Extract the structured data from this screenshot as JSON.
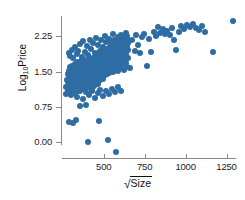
{
  "chart_data": {
    "type": "scatter",
    "title": "",
    "xlabel": "√Size",
    "ylabel": "Log10Price",
    "xlabel_parts": {
      "radical": "√",
      "radicand": "Size"
    },
    "ylabel_parts": {
      "base": "Log",
      "subscript": "10",
      "tail": "Price"
    },
    "xlim": [
      245,
      1320
    ],
    "ylim": [
      -0.35,
      2.72
    ],
    "xticks": [
      500,
      750,
      1000,
      1250
    ],
    "xtick_labels": [
      "500",
      "750",
      "1000",
      "1250"
    ],
    "yticks": [
      0.0,
      0.75,
      1.5,
      2.25
    ],
    "ytick_labels": [
      "0.00",
      "0.75",
      "1.50",
      "2.25"
    ],
    "grid": false,
    "legend": false,
    "marker_color": "#2e6da4",
    "marker_size_px": 6,
    "background": "#ffffff",
    "axis_color": "#8a8a8a",
    "n_points": 268,
    "points": [
      [
        286,
        0.44
      ],
      [
        311,
        0.42
      ],
      [
        330,
        0.47
      ],
      [
        352,
        0.78
      ],
      [
        392,
        0.8
      ],
      [
        405,
        0.02
      ],
      [
        470,
        0.46
      ],
      [
        523,
        0.05
      ],
      [
        572,
        -0.21
      ],
      [
        268,
        1.02
      ],
      [
        272,
        1.18
      ],
      [
        276,
        1.33
      ],
      [
        279,
        1.45
      ],
      [
        281,
        1.12
      ],
      [
        284,
        1.28
      ],
      [
        286,
        1.52
      ],
      [
        288,
        1.38
      ],
      [
        290,
        1.2
      ],
      [
        292,
        1.6
      ],
      [
        294,
        1.05
      ],
      [
        296,
        1.42
      ],
      [
        298,
        1.3
      ],
      [
        300,
        1.55
      ],
      [
        302,
        1.15
      ],
      [
        304,
        1.48
      ],
      [
        306,
        1.62
      ],
      [
        308,
        1.25
      ],
      [
        310,
        1.36
      ],
      [
        312,
        1.5
      ],
      [
        314,
        1.08
      ],
      [
        316,
        1.44
      ],
      [
        318,
        1.58
      ],
      [
        320,
        1.22
      ],
      [
        322,
        1.34
      ],
      [
        324,
        1.66
      ],
      [
        326,
        1.4
      ],
      [
        328,
        1.18
      ],
      [
        330,
        1.54
      ],
      [
        332,
        1.29
      ],
      [
        334,
        1.46
      ],
      [
        336,
        1.7
      ],
      [
        338,
        1.24
      ],
      [
        340,
        1.38
      ],
      [
        342,
        1.6
      ],
      [
        344,
        1.1
      ],
      [
        346,
        1.5
      ],
      [
        348,
        1.32
      ],
      [
        350,
        1.64
      ],
      [
        352,
        1.26
      ],
      [
        354,
        1.44
      ],
      [
        356,
        1.56
      ],
      [
        358,
        1.2
      ],
      [
        360,
        1.72
      ],
      [
        362,
        1.36
      ],
      [
        364,
        1.48
      ],
      [
        366,
        1.14
      ],
      [
        368,
        1.58
      ],
      [
        370,
        1.3
      ],
      [
        372,
        1.66
      ],
      [
        374,
        1.42
      ],
      [
        376,
        1.22
      ],
      [
        378,
        1.52
      ],
      [
        380,
        1.34
      ],
      [
        382,
        1.74
      ],
      [
        384,
        1.46
      ],
      [
        386,
        1.16
      ],
      [
        388,
        1.62
      ],
      [
        390,
        1.28
      ],
      [
        392,
        1.54
      ],
      [
        394,
        1.4
      ],
      [
        396,
        1.68
      ],
      [
        398,
        1.24
      ],
      [
        400,
        1.5
      ],
      [
        402,
        1.36
      ],
      [
        404,
        1.58
      ],
      [
        406,
        1.18
      ],
      [
        408,
        1.44
      ],
      [
        410,
        1.76
      ],
      [
        412,
        1.32
      ],
      [
        414,
        1.6
      ],
      [
        416,
        1.48
      ],
      [
        418,
        1.26
      ],
      [
        420,
        1.7
      ],
      [
        422,
        1.38
      ],
      [
        424,
        1.56
      ],
      [
        426,
        1.12
      ],
      [
        428,
        1.64
      ],
      [
        430,
        1.42
      ],
      [
        432,
        1.3
      ],
      [
        434,
        1.78
      ],
      [
        436,
        1.52
      ],
      [
        438,
        1.2
      ],
      [
        440,
        1.46
      ],
      [
        442,
        1.66
      ],
      [
        444,
        1.34
      ],
      [
        446,
        1.58
      ],
      [
        448,
        1.4
      ],
      [
        450,
        1.72
      ],
      [
        452,
        1.28
      ],
      [
        454,
        1.54
      ],
      [
        456,
        1.44
      ],
      [
        458,
        1.82
      ],
      [
        460,
        1.36
      ],
      [
        462,
        1.62
      ],
      [
        464,
        1.5
      ],
      [
        466,
        1.24
      ],
      [
        468,
        1.68
      ],
      [
        470,
        1.42
      ],
      [
        472,
        1.56
      ],
      [
        474,
        1.86
      ],
      [
        476,
        1.32
      ],
      [
        478,
        1.6
      ],
      [
        480,
        1.48
      ],
      [
        482,
        1.74
      ],
      [
        484,
        1.38
      ],
      [
        486,
        1.64
      ],
      [
        488,
        1.52
      ],
      [
        490,
        1.9
      ],
      [
        492,
        1.44
      ],
      [
        494,
        1.7
      ],
      [
        496,
        1.58
      ],
      [
        498,
        1.34
      ],
      [
        500,
        1.66
      ],
      [
        502,
        1.8
      ],
      [
        504,
        1.5
      ],
      [
        506,
        1.94
      ],
      [
        508,
        1.42
      ],
      [
        510,
        1.72
      ],
      [
        512,
        1.6
      ],
      [
        514,
        1.86
      ],
      [
        516,
        1.54
      ],
      [
        518,
        1.76
      ],
      [
        520,
        1.46
      ],
      [
        522,
        1.98
      ],
      [
        524,
        1.64
      ],
      [
        526,
        1.82
      ],
      [
        528,
        1.56
      ],
      [
        530,
        1.9
      ],
      [
        532,
        1.48
      ],
      [
        534,
        1.7
      ],
      [
        536,
        1.62
      ],
      [
        538,
        2.02
      ],
      [
        540,
        1.78
      ],
      [
        542,
        1.54
      ],
      [
        544,
        1.88
      ],
      [
        546,
        1.66
      ],
      [
        548,
        1.96
      ],
      [
        550,
        1.58
      ],
      [
        552,
        1.8
      ],
      [
        554,
        2.06
      ],
      [
        556,
        1.72
      ],
      [
        558,
        1.5
      ],
      [
        560,
        1.92
      ],
      [
        562,
        1.64
      ],
      [
        564,
        2.0
      ],
      [
        566,
        1.84
      ],
      [
        568,
        1.56
      ],
      [
        570,
        1.74
      ],
      [
        572,
        2.1
      ],
      [
        574,
        1.68
      ],
      [
        576,
        1.94
      ],
      [
        578,
        1.6
      ],
      [
        580,
        1.86
      ],
      [
        582,
        2.04
      ],
      [
        584,
        1.76
      ],
      [
        586,
        1.52
      ],
      [
        588,
        1.98
      ],
      [
        590,
        1.7
      ],
      [
        592,
        2.14
      ],
      [
        594,
        1.88
      ],
      [
        596,
        1.62
      ],
      [
        598,
        1.8
      ],
      [
        600,
        2.06
      ],
      [
        602,
        1.72
      ],
      [
        604,
        1.96
      ],
      [
        606,
        1.58
      ],
      [
        608,
        2.18
      ],
      [
        610,
        1.84
      ],
      [
        612,
        2.02
      ],
      [
        614,
        1.66
      ],
      [
        616,
        1.9
      ],
      [
        618,
        2.08
      ],
      [
        620,
        1.74
      ],
      [
        622,
        2.22
      ],
      [
        624,
        1.94
      ],
      [
        626,
        1.54
      ],
      [
        628,
        2.12
      ],
      [
        630,
        1.8
      ],
      [
        632,
        2.0
      ],
      [
        634,
        1.68
      ],
      [
        636,
        2.16
      ],
      [
        638,
        1.88
      ],
      [
        640,
        2.04
      ],
      [
        642,
        1.6
      ],
      [
        644,
        2.26
      ],
      [
        646,
        1.96
      ],
      [
        648,
        1.78
      ],
      [
        650,
        2.1
      ],
      [
        285,
        1.9
      ],
      [
        295,
        1.84
      ],
      [
        305,
        1.96
      ],
      [
        315,
        1.78
      ],
      [
        325,
        2.02
      ],
      [
        335,
        1.88
      ],
      [
        345,
        1.94
      ],
      [
        355,
        2.08
      ],
      [
        365,
        1.82
      ],
      [
        375,
        2.14
      ],
      [
        385,
        1.92
      ],
      [
        395,
        2.04
      ],
      [
        405,
        1.86
      ],
      [
        415,
        2.18
      ],
      [
        425,
        1.98
      ],
      [
        435,
        2.1
      ],
      [
        445,
        1.9
      ],
      [
        455,
        2.22
      ],
      [
        465,
        2.06
      ],
      [
        475,
        1.94
      ],
      [
        485,
        2.16
      ],
      [
        495,
        2.02
      ],
      [
        505,
        2.26
      ],
      [
        515,
        2.12
      ],
      [
        525,
        1.98
      ],
      [
        535,
        2.2
      ],
      [
        545,
        2.08
      ],
      [
        555,
        2.3
      ],
      [
        565,
        2.16
      ],
      [
        575,
        2.02
      ],
      [
        585,
        2.24
      ],
      [
        595,
        2.12
      ],
      [
        605,
        2.28
      ],
      [
        615,
        2.18
      ],
      [
        625,
        2.08
      ],
      [
        635,
        2.32
      ],
      [
        645,
        2.2
      ],
      [
        300,
        1.0
      ],
      [
        318,
        1.04
      ],
      [
        336,
        0.96
      ],
      [
        354,
        1.08
      ],
      [
        372,
        0.92
      ],
      [
        390,
        1.06
      ],
      [
        408,
        1.0
      ],
      [
        426,
        1.1
      ],
      [
        444,
        0.94
      ],
      [
        462,
        1.04
      ],
      [
        480,
        1.12
      ],
      [
        498,
        0.98
      ],
      [
        516,
        1.08
      ],
      [
        534,
        1.02
      ],
      [
        552,
        1.14
      ],
      [
        570,
        1.06
      ],
      [
        588,
        1.18
      ],
      [
        606,
        1.1
      ],
      [
        660,
        1.58
      ],
      [
        672,
        2.18
      ],
      [
        688,
        1.94
      ],
      [
        700,
        2.28
      ],
      [
        712,
        2.06
      ],
      [
        724,
        1.9
      ],
      [
        736,
        2.24
      ],
      [
        748,
        2.3
      ],
      [
        762,
        1.62
      ],
      [
        776,
        2.2
      ],
      [
        790,
        1.92
      ],
      [
        804,
        2.34
      ],
      [
        818,
        2.26
      ],
      [
        832,
        2.44
      ],
      [
        846,
        2.32
      ],
      [
        860,
        2.4
      ],
      [
        874,
        2.3
      ],
      [
        888,
        2.36
      ],
      [
        902,
        2.28
      ],
      [
        916,
        2.42
      ],
      [
        930,
        2.18
      ],
      [
        944,
        1.96
      ],
      [
        958,
        2.34
      ],
      [
        972,
        2.46
      ],
      [
        990,
        2.4
      ],
      [
        1010,
        2.48
      ],
      [
        1028,
        2.44
      ],
      [
        1046,
        2.5
      ],
      [
        1064,
        2.42
      ],
      [
        1082,
        2.38
      ],
      [
        1100,
        2.46
      ],
      [
        1118,
        2.34
      ],
      [
        1170,
        1.92
      ],
      [
        1290,
        2.58
      ]
    ]
  }
}
